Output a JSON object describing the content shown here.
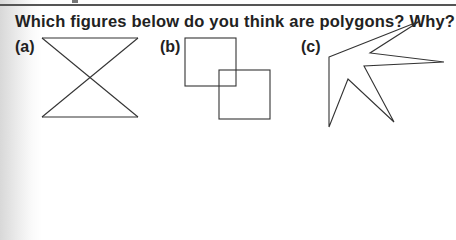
{
  "question": "Which figures below do you think are polygons? Why?",
  "figures": [
    {
      "label": "(a)",
      "description": "bowtie: two triangles sharing a crossing point"
    },
    {
      "label": "(b)",
      "description": "two overlapping squares"
    },
    {
      "label": "(c)",
      "description": "star-like concave polygon"
    }
  ]
}
